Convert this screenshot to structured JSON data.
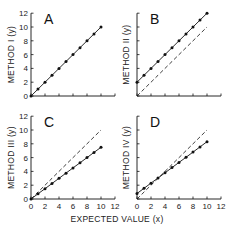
{
  "chart_data": {
    "type": "line",
    "layout": "2x2 grid of panels",
    "xlabel": "EXPECTED VALUE (x)",
    "xlim": [
      0,
      12
    ],
    "ylim": [
      0,
      12
    ],
    "xticks": [
      0,
      2,
      4,
      6,
      8,
      10,
      12
    ],
    "yticks": [
      0,
      2,
      4,
      6,
      8,
      10,
      12
    ],
    "grid": false,
    "panels": [
      {
        "letter": "A",
        "ylabel": "METHOD I (y)",
        "x": [
          0,
          1,
          2,
          3,
          4,
          5,
          6,
          7,
          8,
          9,
          10
        ],
        "series": [
          {
            "name": "measured",
            "style": "solid-with-markers",
            "values": [
              0,
              1,
              2,
              3,
              4,
              5,
              6,
              7,
              8,
              9,
              10
            ]
          }
        ]
      },
      {
        "letter": "B",
        "ylabel": "METHOD II (y)",
        "x": [
          0,
          1,
          2,
          3,
          4,
          5,
          6,
          7,
          8,
          9,
          10
        ],
        "series": [
          {
            "name": "measured",
            "style": "solid-with-markers",
            "values": [
              2,
              3,
              4,
              5,
              6,
              7,
              8,
              9,
              10,
              11,
              12
            ]
          },
          {
            "name": "identity",
            "style": "dashed",
            "values": [
              0,
              1,
              2,
              3,
              4,
              5,
              6,
              7,
              8,
              9,
              10
            ]
          }
        ]
      },
      {
        "letter": "C",
        "ylabel": "METHOD III (y)",
        "x": [
          0,
          1,
          2,
          3,
          4,
          5,
          6,
          7,
          8,
          9,
          10
        ],
        "series": [
          {
            "name": "measured",
            "style": "solid-with-markers",
            "values": [
              0,
              0.75,
              1.5,
              2.25,
              3,
              3.75,
              4.5,
              5.25,
              6,
              6.75,
              7.5
            ]
          },
          {
            "name": "identity",
            "style": "dashed",
            "values": [
              0,
              1,
              2,
              3,
              4,
              5,
              6,
              7,
              8,
              9,
              10
            ]
          }
        ]
      },
      {
        "letter": "D",
        "ylabel": "METHOD IV (y)",
        "x": [
          0,
          1,
          2,
          3,
          4,
          5,
          6,
          7,
          8,
          9,
          10
        ],
        "series": [
          {
            "name": "measured",
            "style": "solid-with-markers",
            "values": [
              0.8,
              1.55,
              2.3,
              3.05,
              3.8,
              4.55,
              5.3,
              6.05,
              6.8,
              7.55,
              8.3
            ]
          },
          {
            "name": "identity",
            "style": "dashed",
            "values": [
              0,
              1,
              2,
              3,
              4,
              5,
              6,
              7,
              8,
              9,
              10
            ]
          }
        ]
      }
    ]
  },
  "labels": {
    "xlabel": "EXPECTED VALUE (x)",
    "panelA": {
      "letter": "A",
      "ylabel": "METHOD I (y)"
    },
    "panelB": {
      "letter": "B",
      "ylabel": "METHOD II (y)"
    },
    "panelC": {
      "letter": "C",
      "ylabel": "METHOD III (y)"
    },
    "panelD": {
      "letter": "D",
      "ylabel": "METHOD IV (y)"
    }
  },
  "colors": {
    "line": "#111111",
    "text": "#222222",
    "background": "#ffffff"
  }
}
